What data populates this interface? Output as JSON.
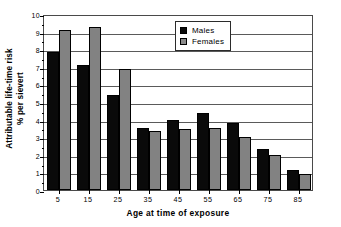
{
  "chart_data": {
    "type": "bar",
    "title": "",
    "xlabel": "Age at time of exposure",
    "ylabel": "Attributable life-time risk\n% per sievert",
    "ylabel_line1": "Attributable life-time risk",
    "ylabel_line2": "% per sievert",
    "categories": [
      "5",
      "15",
      "25",
      "35",
      "45",
      "55",
      "65",
      "75",
      "85"
    ],
    "series": [
      {
        "name": "Males",
        "color": "#0a0a0a",
        "values": [
          7.85,
          7.1,
          5.4,
          3.5,
          4.0,
          4.4,
          3.8,
          2.35,
          1.15
        ]
      },
      {
        "name": "Females",
        "color": "#828282",
        "values": [
          9.1,
          9.25,
          6.85,
          3.35,
          3.45,
          3.5,
          3.0,
          2.0,
          0.9
        ]
      }
    ],
    "ylim": [
      0,
      10
    ],
    "ytick_values": [
      0,
      1,
      2,
      3,
      4,
      5,
      6,
      7,
      8,
      9,
      10
    ],
    "ytick_labels": [
      "0",
      "1",
      "2",
      "3",
      "4",
      "5",
      "6",
      "7",
      "8",
      "9",
      "10"
    ],
    "grid": true,
    "grid_axis": "y",
    "legend_position": "upper right",
    "legend_entries": [
      "Males",
      "Females"
    ]
  }
}
